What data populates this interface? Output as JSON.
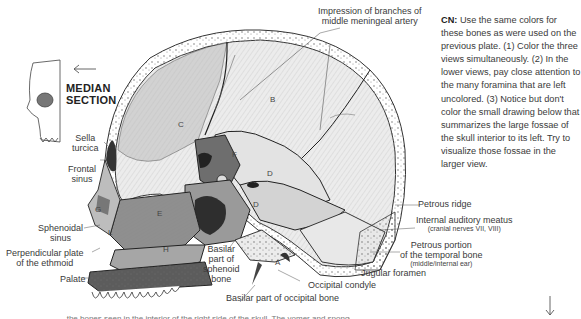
{
  "title": {
    "median_section": [
      "MEDIAN",
      "SECTION"
    ]
  },
  "cn_note": {
    "prefix": "CN:",
    "text": " Use the same colors for these bones as were used on the previous plate. (1) Color the three views simultaneously. (2) In the lower views, pay close attention to the many foramina that are left uncolored. (3) Notice but don't color the small drawing below that summarizes the large fossae of the skull interior to its left. Try to visualize those fossae in the larger view."
  },
  "labels": {
    "impression": [
      "Impression of branches of",
      "middle meningeal artery"
    ],
    "sella_turcica": [
      "Sella",
      "turcica"
    ],
    "frontal_sinus": [
      "Frontal",
      "sinus"
    ],
    "sphenoidal_sinus": [
      "Sphenoidal",
      "sinus"
    ],
    "perpendicular_plate": [
      "Perpendicular plate",
      "of the ethmoid"
    ],
    "palate": "Palate",
    "basilar_sphenoid": [
      "Basilar",
      "part of",
      "sphenoid",
      "bone"
    ],
    "basilar_occipital": "Basilar part of occipital bone",
    "occipital_condyle": "Occipital condyle",
    "jugular_foramen": "Jugular foramen",
    "petrous_ridge": "Petrous ridge",
    "internal_auditory_meatus": "Internal auditory meatus",
    "internal_auditory_meatus_sub": "(cranial nerves VII, VIII)",
    "petrous_portion": [
      "Petrous portion",
      "of the temporal bone"
    ],
    "petrous_portion_sub": "(middle/internal ear)"
  },
  "bone_letters": {
    "B": "B",
    "C": "C",
    "D1": "D",
    "D2": "D",
    "D3": "D",
    "E": "E",
    "E2": "E",
    "F": "F",
    "G": "G",
    "H": "H",
    "L": "L",
    "A": "A",
    "K": "K"
  },
  "bottom_text": "...the bones seen in the interior of the right side of the skull. The vomer and sponge...",
  "arrows": {
    "left_arrow": "left-arrow-icon",
    "down_arrow": "down-arrow-icon"
  }
}
